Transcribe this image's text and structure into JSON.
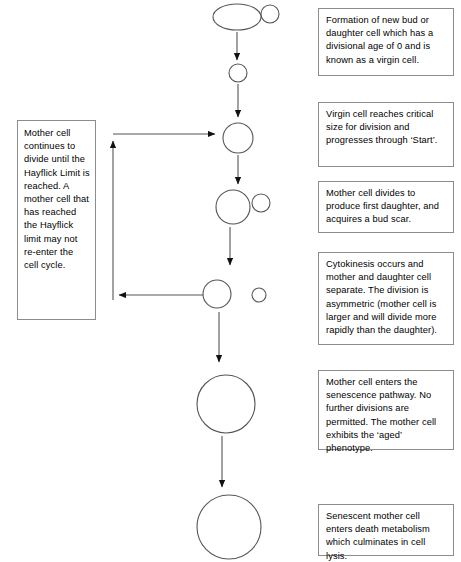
{
  "diagram": {
    "colors": {
      "background": "#ffffff",
      "stroke": "#555555",
      "box_border": "#8c8c8c",
      "text": "#000000",
      "arrow_fill": "#111111"
    }
  },
  "notes": {
    "bud": "Formation of new bud or daughter cell which has a divisional age of 0 and is known as a virgin cell.",
    "virgin": "Virgin cell reaches critical size for division and progresses through ‘Start’.",
    "divide": "Mother cell divides to produce first daughter, and acquires a bud scar.",
    "cytokinesis": "Cytokinesis occurs and mother and daughter cell separate. The division is asymmetric (mother cell is larger and will divide more rapidly than the daughter).",
    "senescence": "Mother cell enters the senescence pathway. No further divisions are permitted. The mother cell exhibits the ‘aged’ phenotype.",
    "death": "Senescent mother cell enters death metabolism which culminates in cell lysis.",
    "hayflick": "Mother cell continues to divide until the Hayflick Limit is reached. A mother cell that has reached the Hayflick limit may not re-enter the cell cycle."
  },
  "stages": [
    {
      "id": "budding-mother-cell",
      "label": "Mother cell with new bud",
      "shape": "ellipse-with-bud",
      "cx": 237,
      "cy": 17,
      "rx": 24,
      "ry": 13,
      "bud_cx": 270,
      "bud_cy": 14,
      "bud_r": 9
    },
    {
      "id": "virgin-cell",
      "label": "Virgin cell",
      "shape": "circle",
      "cx": 238,
      "cy": 73,
      "r": 9
    },
    {
      "id": "grown-virgin-cell",
      "label": "Virgin cell at critical size",
      "shape": "circle",
      "cx": 238,
      "cy": 138,
      "r": 15
    },
    {
      "id": "dividing-mother-cell",
      "label": "Dividing mother cell with first daughter",
      "shape": "circle-with-bud",
      "cx": 233,
      "cy": 207,
      "r": 17,
      "bud_cx": 261,
      "bud_cy": 203,
      "bud_r": 9
    },
    {
      "id": "separated-mother-cell",
      "label": "Separated mother cell",
      "shape": "circle",
      "cx": 217,
      "cy": 294,
      "r": 14
    },
    {
      "id": "separated-daughter-cell",
      "label": "Separated daughter cell",
      "shape": "circle",
      "cx": 259,
      "cy": 295,
      "r": 7
    },
    {
      "id": "senescent-mother-cell",
      "label": "Senescent mother cell",
      "shape": "circle",
      "cx": 226,
      "cy": 404,
      "r": 29
    },
    {
      "id": "dying-mother-cell",
      "label": "Dying mother cell",
      "shape": "circle",
      "cx": 229,
      "cy": 527,
      "r": 32
    }
  ],
  "arrows": [
    {
      "id": "arrow-bud-to-virgin",
      "from": "budding-mother-cell",
      "to": "virgin-cell",
      "direction": "down"
    },
    {
      "id": "arrow-virgin-to-grown",
      "from": "virgin-cell",
      "to": "grown-virgin-cell",
      "direction": "down"
    },
    {
      "id": "arrow-grown-to-dividing",
      "from": "grown-virgin-cell",
      "to": "dividing-mother-cell",
      "direction": "down"
    },
    {
      "id": "arrow-dividing-to-separated",
      "from": "dividing-mother-cell",
      "to": "separated-mother-cell",
      "direction": "down"
    },
    {
      "id": "arrow-separated-to-senescent",
      "from": "separated-mother-cell",
      "to": "senescent-mother-cell",
      "direction": "down"
    },
    {
      "id": "arrow-senescent-to-dying",
      "from": "senescent-mother-cell",
      "to": "dying-mother-cell",
      "direction": "down"
    },
    {
      "id": "arrow-recycle-loop",
      "from": "separated-mother-cell",
      "to": "grown-virgin-cell",
      "direction": "left-up-right",
      "note": "Mother cell re-enters the cell cycle"
    }
  ]
}
